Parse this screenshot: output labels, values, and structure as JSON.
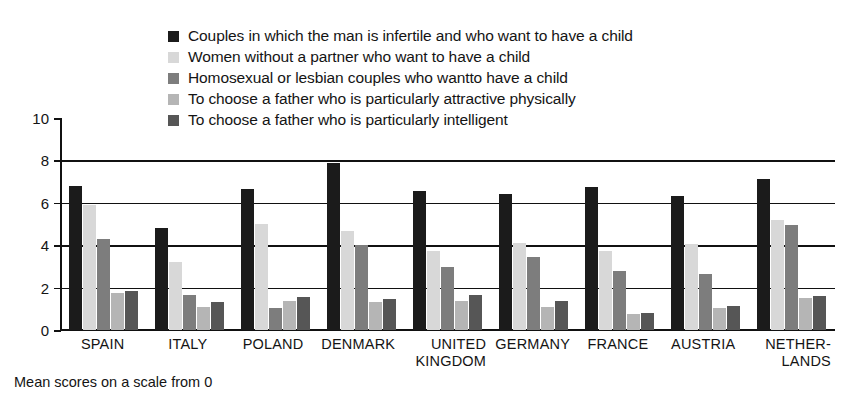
{
  "footnote": "Mean scores on a scale from 0",
  "legend": {
    "items": [
      {
        "label": "Couples in which the man is infertile and who want to have a child",
        "color": "#1b1b1b"
      },
      {
        "label": "Women without a partner who want to have a child",
        "color": "#d8d8d8"
      },
      {
        "label": "Homosexual or lesbian couples who wantto have a child",
        "color": "#7d7d7d"
      },
      {
        "label": "To choose a father who is particularly attractive physically",
        "color": "#b5b5b5"
      },
      {
        "label": "To choose a father who is particularly intelligent",
        "color": "#565656"
      }
    ]
  },
  "chart_data": {
    "type": "bar",
    "title": "",
    "xlabel": "",
    "ylabel": "",
    "ylim": [
      0,
      10
    ],
    "yticks": [
      0,
      2,
      4,
      6,
      8,
      10
    ],
    "grid": true,
    "gridlines_at": [
      2,
      4,
      6,
      8
    ],
    "legend_position": "top",
    "note": "Mean scores on a scale from 0",
    "categories": [
      "SPAIN",
      "ITALY",
      "POLAND",
      "DENMARK",
      "UNITED\nKINGDOM",
      "GERMANY",
      "FRANCE",
      "AUSTRIA",
      "NETHER-\nLANDS"
    ],
    "series": [
      {
        "name": "Couples in which the man is infertile and who want to have a child",
        "color": "#1b1b1b",
        "values": [
          6.8,
          4.8,
          6.65,
          7.9,
          6.55,
          6.4,
          6.75,
          6.3,
          7.1
        ]
      },
      {
        "name": "Women without a partner who want to have a child",
        "color": "#d8d8d8",
        "values": [
          5.9,
          3.2,
          5.0,
          4.65,
          3.75,
          4.1,
          3.75,
          4.05,
          5.2
        ]
      },
      {
        "name": "Homosexual or lesbian couples who wantto have a child",
        "color": "#7d7d7d",
        "values": [
          4.3,
          1.65,
          1.05,
          4.0,
          2.95,
          3.45,
          2.8,
          2.65,
          4.95
        ]
      },
      {
        "name": "To choose a father who is particularly attractive physically",
        "color": "#b5b5b5",
        "values": [
          1.75,
          1.1,
          1.35,
          1.3,
          1.35,
          1.1,
          0.75,
          1.05,
          1.5
        ]
      },
      {
        "name": "To choose a father who is particularly intelligent",
        "color": "#565656",
        "values": [
          1.85,
          1.3,
          1.55,
          1.45,
          1.65,
          1.35,
          0.8,
          1.15,
          1.6
        ]
      }
    ]
  }
}
